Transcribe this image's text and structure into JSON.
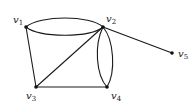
{
  "diagram": {
    "type": "multigraph",
    "vertices": [
      {
        "id": "v1",
        "label": "v",
        "subscript": "1",
        "x": 26,
        "y": 27,
        "lx": 13,
        "ly": 21
      },
      {
        "id": "v2",
        "label": "v",
        "subscript": "2",
        "x": 103,
        "y": 27,
        "lx": 106,
        "ly": 21
      },
      {
        "id": "v3",
        "label": "v",
        "subscript": "3",
        "x": 36,
        "y": 87,
        "lx": 26,
        "ly": 99
      },
      {
        "id": "v4",
        "label": "v",
        "subscript": "4",
        "x": 107,
        "y": 87,
        "lx": 111,
        "ly": 99
      },
      {
        "id": "v5",
        "label": "v",
        "subscript": "5",
        "x": 172,
        "y": 53,
        "lx": 178,
        "ly": 58
      }
    ],
    "edges": [
      {
        "from": "v1",
        "to": "v2",
        "kind": "curve-upper"
      },
      {
        "from": "v1",
        "to": "v2",
        "kind": "curve-lower"
      },
      {
        "from": "v1",
        "to": "v3",
        "kind": "straight"
      },
      {
        "from": "v3",
        "to": "v2",
        "kind": "straight"
      },
      {
        "from": "v3",
        "to": "v4",
        "kind": "straight"
      },
      {
        "from": "v2",
        "to": "v4",
        "kind": "curve-left"
      },
      {
        "from": "v2",
        "to": "v4",
        "kind": "curve-right"
      },
      {
        "from": "v2",
        "to": "v5",
        "kind": "straight"
      }
    ],
    "colors": {
      "edge": "#1a1a1a",
      "node": "#111111",
      "label": "#222222"
    }
  },
  "labels": {
    "v1": {
      "main": "v",
      "sub": "1"
    },
    "v2": {
      "main": "v",
      "sub": "2"
    },
    "v3": {
      "main": "v",
      "sub": "3"
    },
    "v4": {
      "main": "v",
      "sub": "4"
    },
    "v5": {
      "main": "v",
      "sub": "5"
    }
  }
}
